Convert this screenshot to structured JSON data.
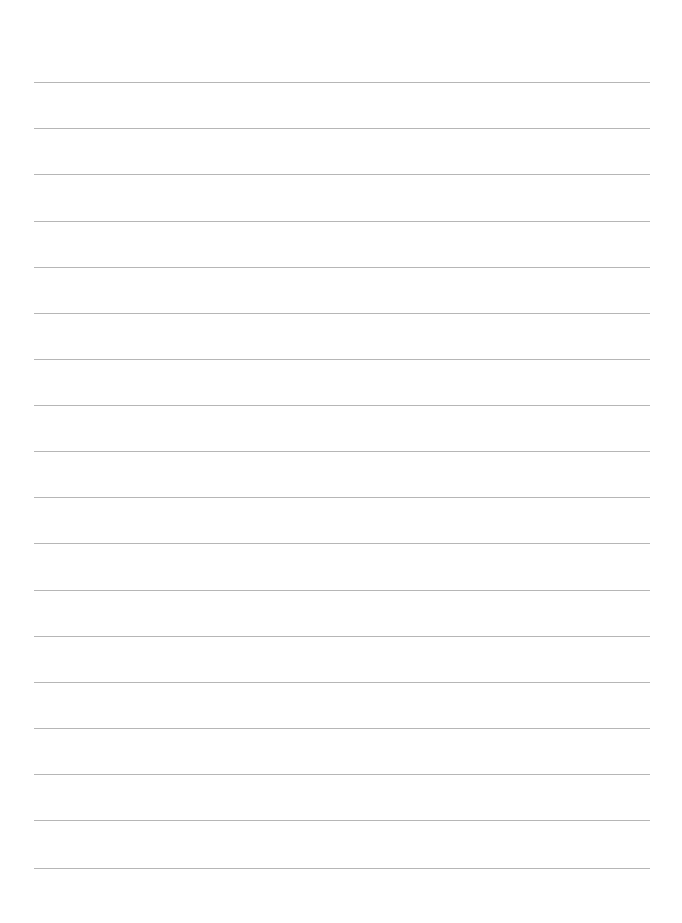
{
  "document": {
    "type": "lined-paper",
    "background_color": "#ffffff",
    "rule_color": "#a9a9a9",
    "rule_count": 18,
    "rules_y": [
      82,
      128,
      174,
      221,
      267,
      313,
      359,
      405,
      451,
      497,
      543,
      590,
      636,
      682,
      728,
      774,
      820,
      868
    ],
    "rule_x_start": 34,
    "rule_x_end": 650,
    "text_lines": []
  }
}
